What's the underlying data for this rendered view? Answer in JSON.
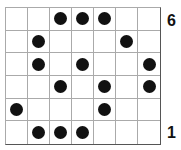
{
  "grid": {
    "columns": 7,
    "rows": 6,
    "rows_top_to_bottom": [
      [
        0,
        0,
        1,
        1,
        1,
        0,
        0
      ],
      [
        0,
        1,
        0,
        0,
        0,
        1,
        0
      ],
      [
        0,
        1,
        0,
        1,
        0,
        0,
        1
      ],
      [
        0,
        0,
        1,
        0,
        1,
        0,
        1
      ],
      [
        1,
        0,
        0,
        0,
        1,
        0,
        0
      ],
      [
        0,
        1,
        1,
        1,
        0,
        0,
        0
      ]
    ],
    "dot_color": "#111111",
    "line_color": "#aaaaaa"
  },
  "labels": {
    "top": "6",
    "bottom": "1"
  }
}
